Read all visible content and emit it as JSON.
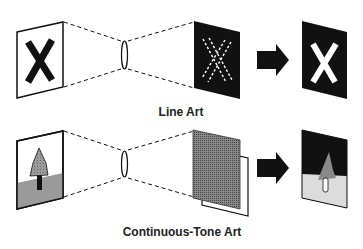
{
  "diagram": {
    "colors": {
      "ink": "#111111",
      "background": "#ffffff",
      "tree_gray": "#8a8a8a",
      "ground_gray": "#9a9a9a",
      "light_gray": "#dcdcdc",
      "screen_gray": "#6e6e6e"
    },
    "rows": [
      {
        "id": "line-art",
        "label": "Line Art",
        "stages": [
          "original-artwork-x",
          "lens",
          "film-negative-dashed-x",
          "arrow",
          "negative-white-x"
        ]
      },
      {
        "id": "continuous-tone-art",
        "label": "Continuous-Tone Art",
        "stages": [
          "original-photo-tree",
          "lens",
          "halftone-screen-over-film",
          "arrow",
          "halftone-negative-tree"
        ]
      }
    ]
  }
}
